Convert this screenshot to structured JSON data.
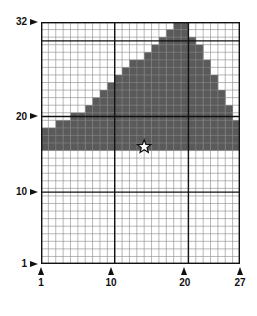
{
  "grid": {
    "columns": 27,
    "rows": 32,
    "fill_color": "#5a5a5a",
    "line_color": "#888888",
    "major_line_color": "#111111",
    "shade_bottom_row": 16,
    "column_top_rows": [
      18,
      18,
      19,
      19,
      20,
      20,
      21,
      22,
      23,
      24,
      25,
      26,
      27,
      27,
      28,
      29,
      30,
      31,
      32,
      32,
      30,
      29,
      27,
      25,
      23,
      21,
      19
    ],
    "major_rows": [
      10,
      20,
      30
    ],
    "major_cols": [
      10,
      20
    ]
  },
  "y_axis": {
    "labels": [
      {
        "text": "32",
        "row": 32
      },
      {
        "text": "20",
        "row": 20
      },
      {
        "text": "10",
        "row": 10
      },
      {
        "text": "1",
        "row": 1
      }
    ]
  },
  "x_axis": {
    "labels": [
      {
        "text": "1",
        "col": 1
      },
      {
        "text": "10",
        "col": 10
      },
      {
        "text": "20",
        "col": 20
      },
      {
        "text": "27",
        "col": 27
      }
    ]
  },
  "marker": {
    "type": "star",
    "col": 14,
    "row": 16
  }
}
